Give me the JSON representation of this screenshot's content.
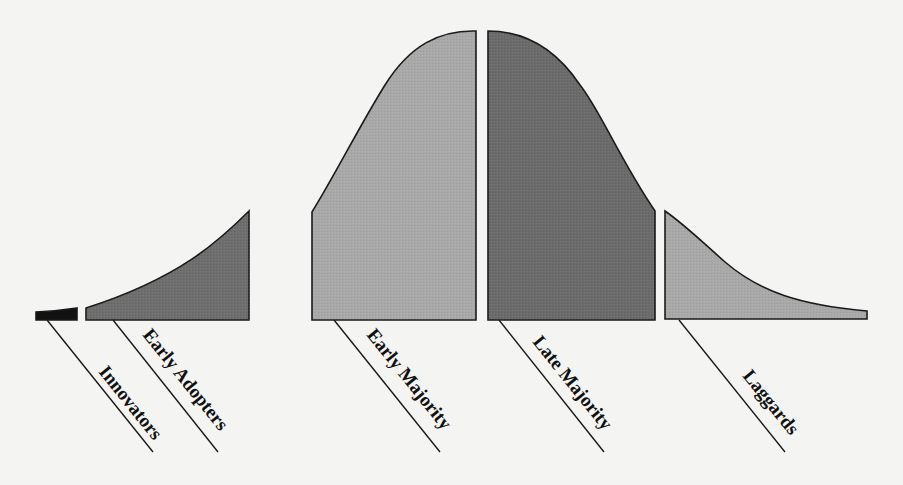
{
  "diagram": {
    "type": "technology-adoption-lifecycle",
    "background_color": "#f4f4f2",
    "segments": [
      {
        "id": "innovators",
        "label": "Innovators",
        "color": "#111111"
      },
      {
        "id": "early-adopters",
        "label": "Early Adopters",
        "color": "#6e6e6e"
      },
      {
        "id": "early-majority",
        "label": "Early Majority",
        "color": "#a9a9a9"
      },
      {
        "id": "late-majority",
        "label": "Late Majority",
        "color": "#6b6b6b"
      },
      {
        "id": "laggards",
        "label": "Laggards",
        "color": "#a9a9a9"
      }
    ]
  }
}
